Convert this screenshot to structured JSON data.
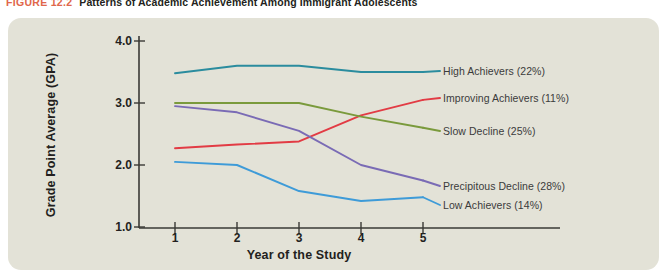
{
  "caption": {
    "figure_number": "FIGURE 12.2",
    "text": "Patterns of Academic Achievement Among Immigrant Adolescents"
  },
  "colors": {
    "panel_background": "#e3e2d7",
    "page_background": "#ffffff",
    "axis": "#3a3a36",
    "caption_accent": "#e0674b",
    "text": "#231f20",
    "high_achievers": "#2b8c9e",
    "improving_achievers": "#e23b44",
    "slow_decline": "#7a9a3c",
    "precipitous_decline": "#7a6bb5",
    "low_achievers": "#3e9bd8"
  },
  "chart_data": {
    "type": "line",
    "title": "Patterns of Academic Achievement Among Immigrant Adolescents",
    "xlabel": "Year of the Study",
    "ylabel": "Grade Point Average (GPA)",
    "x": [
      1,
      2,
      3,
      4,
      5
    ],
    "xticklabels": [
      "1",
      "2",
      "3",
      "4",
      "5"
    ],
    "yticklabels": [
      "1.0",
      "2.0",
      "3.0",
      "4.0"
    ],
    "yticks": [
      1.0,
      2.0,
      3.0,
      4.0
    ],
    "xlim": [
      1,
      5
    ],
    "ylim": [
      1.0,
      4.0
    ],
    "grid": false,
    "legend_position": "inline-right",
    "series": [
      {
        "name": "High Achievers (22%)",
        "label_short": "High Achievers",
        "percent": "22%",
        "color": "#2b8c9e",
        "values": [
          3.48,
          3.6,
          3.6,
          3.5,
          3.5
        ]
      },
      {
        "name": "Improving Achievers (11%)",
        "label_short": "Improving Achievers",
        "percent": "11%",
        "color": "#e23b44",
        "values": [
          2.27,
          2.33,
          2.38,
          2.8,
          3.05
        ]
      },
      {
        "name": "Slow Decline (25%)",
        "label_short": "Slow Decline",
        "percent": "25%",
        "color": "#7a9a3c",
        "values": [
          3.0,
          3.0,
          3.0,
          2.78,
          2.6
        ]
      },
      {
        "name": "Precipitous Decline (28%)",
        "label_short": "Precipitous Decline",
        "percent": "28%",
        "color": "#7a6bb5",
        "values": [
          2.95,
          2.85,
          2.55,
          2.0,
          1.75
        ]
      },
      {
        "name": "Low Achievers (14%)",
        "label_short": "Low Achievers",
        "percent": "14%",
        "color": "#3e9bd8",
        "values": [
          2.05,
          2.0,
          1.58,
          1.42,
          1.48
        ]
      }
    ]
  }
}
